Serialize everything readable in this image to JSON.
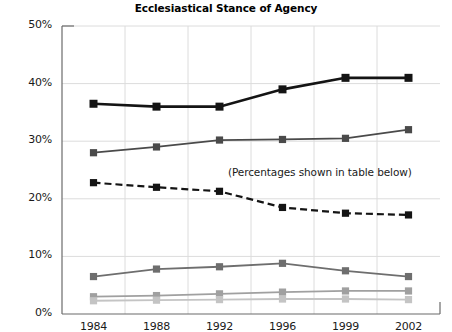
{
  "chart_data": {
    "type": "line",
    "title": "Ecclesiastical Stance of Agency",
    "xlabel": "",
    "ylabel": "",
    "categories": [
      "1984",
      "1988",
      "1992",
      "1996",
      "1999",
      "2002"
    ],
    "x_tick_labels": [
      "1984",
      "1988",
      "1992",
      "1996",
      "1999",
      "2002"
    ],
    "y_tick_labels": [
      "0%",
      "10%",
      "20%",
      "30%",
      "40%",
      "50%"
    ],
    "y_tick_values": [
      0,
      10,
      20,
      30,
      40,
      50
    ],
    "ylim": [
      0,
      50
    ],
    "grid": true,
    "grid_axis": "y",
    "legend": false,
    "legend_position": "none",
    "annotations": [
      {
        "text": "(Percentages shown in table below)",
        "x_category": "1994",
        "y_value": 24.5
      }
    ],
    "series": [
      {
        "name": "series-1",
        "style": "solid",
        "color": "#141414",
        "line_width": 2.6,
        "marker": "square",
        "values": [
          36.5,
          36.0,
          36.0,
          39.0,
          41.0,
          41.0
        ]
      },
      {
        "name": "series-2",
        "style": "solid",
        "color": "#4a4a4a",
        "line_width": 1.8,
        "marker": "square",
        "values": [
          28.0,
          29.0,
          30.2,
          30.3,
          30.5,
          32.0
        ]
      },
      {
        "name": "series-3",
        "style": "dashed",
        "color": "#141414",
        "line_width": 2.2,
        "marker": "square",
        "values": [
          22.8,
          22.0,
          21.3,
          18.5,
          17.5,
          17.2
        ]
      },
      {
        "name": "series-4",
        "style": "solid",
        "color": "#6e6e6e",
        "line_width": 1.8,
        "marker": "square",
        "values": [
          6.5,
          7.8,
          8.2,
          8.8,
          7.5,
          6.5
        ]
      },
      {
        "name": "series-5",
        "style": "solid",
        "color": "#a0a0a0",
        "line_width": 1.8,
        "marker": "square",
        "values": [
          3.0,
          3.2,
          3.5,
          3.8,
          4.0,
          4.0
        ]
      },
      {
        "name": "series-6",
        "style": "solid",
        "color": "#c4c4c4",
        "line_width": 1.8,
        "marker": "square",
        "values": [
          2.3,
          2.4,
          2.5,
          2.6,
          2.6,
          2.5
        ]
      }
    ]
  },
  "axis_colors": {
    "axis_line": "#6b6b6b",
    "gridline": "#dcdcdc",
    "tick_text": "#1a1a1a"
  }
}
